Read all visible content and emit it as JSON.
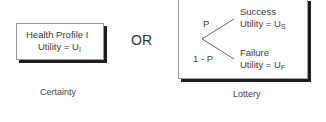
{
  "certainty": {
    "line1": "Health Profile I",
    "line2_prefix": "Utility = U",
    "line2_sub": "I",
    "caption": "Certainty"
  },
  "connector": "OR",
  "lottery": {
    "prob_success": "P",
    "prob_failure": "1 - P",
    "success": {
      "label": "Success",
      "utility_prefix": "Utility = U",
      "utility_sub": "S"
    },
    "failure": {
      "label": "Failure",
      "utility_prefix": "Utility = U",
      "utility_sub": "F"
    },
    "caption": "Lottery"
  }
}
